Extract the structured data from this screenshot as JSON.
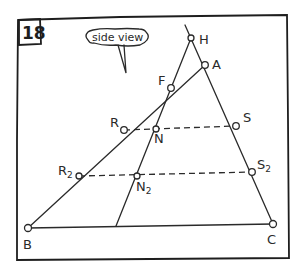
{
  "panel": {
    "number": "18",
    "callout": "side view"
  },
  "points": {
    "H": {
      "label": "H"
    },
    "A": {
      "label": "A"
    },
    "F": {
      "label": "F"
    },
    "R": {
      "label": "R"
    },
    "N": {
      "label": "N"
    },
    "S": {
      "label": "S"
    },
    "R2": {
      "label": "R",
      "sub": "2"
    },
    "N2": {
      "label": "N",
      "sub": "2"
    },
    "S2": {
      "label": "S",
      "sub": "2"
    },
    "B": {
      "label": "B"
    },
    "C": {
      "label": "C"
    }
  },
  "colors": {
    "ink": "#2a2a2a",
    "paper": "#ffffff"
  }
}
